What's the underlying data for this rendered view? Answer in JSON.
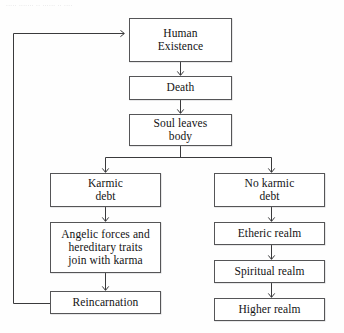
{
  "figure": {
    "type": "flowchart",
    "scan_remnant_text": "..... ....... .. ...... .. ....",
    "colors": {
      "box_border": "#555557",
      "box_fill": "#ffffff",
      "connector": "#3a3a3c",
      "page_background": "#fefefe"
    }
  },
  "nodes": [
    {
      "id": "human-existence",
      "label": "Human\nExistence"
    },
    {
      "id": "death",
      "label": "Death"
    },
    {
      "id": "soul-leaves-body",
      "label": "Soul leaves\nbody"
    },
    {
      "id": "karmic-debt",
      "label": "Karmic\ndebt"
    },
    {
      "id": "no-karmic-debt",
      "label": "No karmic\ndebt"
    },
    {
      "id": "angelic-forces",
      "label": "Angelic forces and\nhereditary traits\njoin with karma"
    },
    {
      "id": "etheric-realm",
      "label": "Etheric realm"
    },
    {
      "id": "reincarnation",
      "label": "Reincarnation"
    },
    {
      "id": "spiritual-realm",
      "label": "Spiritual realm"
    },
    {
      "id": "higher-realm",
      "label": "Higher realm"
    }
  ],
  "edges": [
    {
      "from": "human-existence",
      "to": "death",
      "style": "arrow"
    },
    {
      "from": "death",
      "to": "soul-leaves-body",
      "style": "arrow"
    },
    {
      "from": "soul-leaves-body",
      "to": "karmic-debt",
      "style": "arrow-split-left"
    },
    {
      "from": "soul-leaves-body",
      "to": "no-karmic-debt",
      "style": "arrow-split-right"
    },
    {
      "from": "karmic-debt",
      "to": "angelic-forces",
      "style": "arrow"
    },
    {
      "from": "angelic-forces",
      "to": "reincarnation",
      "style": "arrow"
    },
    {
      "from": "reincarnation",
      "to": "human-existence",
      "style": "feedback-loop-left"
    },
    {
      "from": "no-karmic-debt",
      "to": "etheric-realm",
      "style": "arrow"
    },
    {
      "from": "etheric-realm",
      "to": "spiritual-realm",
      "style": "arrow"
    },
    {
      "from": "spiritual-realm",
      "to": "higher-realm",
      "style": "arrow"
    }
  ]
}
